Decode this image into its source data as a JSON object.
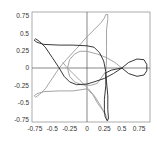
{
  "chart_data": {
    "type": "line",
    "title": "",
    "xlabel": "",
    "ylabel": "",
    "xlim": [
      -0.8,
      0.9
    ],
    "ylim": [
      -0.8,
      0.8
    ],
    "grid": false,
    "axes_through_origin": true,
    "x_ticks": [
      -0.75,
      -0.5,
      -0.25,
      0,
      0.25,
      0.5,
      0.75
    ],
    "x_tick_labels": [
      "-0.75",
      "-0.5",
      "-0.25",
      "0",
      "0.25",
      "0.5",
      "0.75"
    ],
    "y_ticks": [
      0.75,
      0.5,
      0.25,
      0,
      -0.25,
      -0.5,
      -0.75
    ],
    "y_tick_labels": [
      "0.75",
      "0.5",
      "0.25",
      "0",
      "-0.25",
      "-0.5",
      "-0.75"
    ],
    "series": [
      {
        "name": "dark curve",
        "color": "#222222",
        "points": [
          [
            -0.4,
            0.0
          ],
          [
            -0.5,
            0.15
          ],
          [
            -0.6,
            0.3
          ],
          [
            -0.68,
            0.38
          ],
          [
            -0.74,
            0.42
          ],
          [
            -0.76,
            0.4
          ],
          [
            -0.72,
            0.37
          ],
          [
            -0.62,
            0.34
          ],
          [
            -0.4,
            0.33
          ],
          [
            -0.2,
            0.33
          ],
          [
            0.0,
            0.32
          ],
          [
            0.1,
            0.3
          ],
          [
            0.18,
            0.22
          ],
          [
            0.24,
            0.1
          ],
          [
            0.27,
            -0.05
          ],
          [
            0.27,
            -0.25
          ],
          [
            0.25,
            -0.45
          ],
          [
            0.25,
            -0.6
          ],
          [
            0.26,
            -0.7
          ],
          [
            0.29,
            -0.76
          ],
          [
            0.31,
            -0.73
          ],
          [
            0.3,
            -0.6
          ],
          [
            0.3,
            -0.4
          ],
          [
            0.28,
            -0.2
          ],
          [
            0.27,
            -0.07
          ],
          [
            0.35,
            -0.03
          ],
          [
            0.5,
            0.0
          ],
          [
            0.6,
            0.08
          ],
          [
            0.72,
            0.13
          ],
          [
            0.82,
            0.12
          ],
          [
            0.86,
            0.05
          ],
          [
            0.86,
            -0.04
          ],
          [
            0.82,
            -0.1
          ],
          [
            0.72,
            -0.12
          ],
          [
            0.6,
            -0.08
          ],
          [
            0.5,
            0.0
          ],
          [
            0.38,
            -0.08
          ],
          [
            0.25,
            -0.15
          ],
          [
            0.1,
            -0.2
          ],
          [
            0.0,
            -0.23
          ],
          [
            -0.15,
            -0.24
          ],
          [
            -0.25,
            -0.2
          ],
          [
            -0.33,
            -0.12
          ],
          [
            -0.4,
            0.0
          ]
        ]
      },
      {
        "name": "gray curve",
        "color": "#9a9a9a",
        "points": [
          [
            -0.4,
            0.0
          ],
          [
            -0.5,
            -0.15
          ],
          [
            -0.6,
            -0.3
          ],
          [
            -0.68,
            -0.38
          ],
          [
            -0.74,
            -0.42
          ],
          [
            -0.76,
            -0.4
          ],
          [
            -0.72,
            -0.37
          ],
          [
            -0.62,
            -0.34
          ],
          [
            -0.4,
            -0.33
          ],
          [
            -0.2,
            -0.33
          ],
          [
            0.0,
            -0.3
          ],
          [
            0.08,
            -0.38
          ],
          [
            0.15,
            -0.5
          ],
          [
            0.22,
            -0.6
          ],
          [
            0.27,
            -0.68
          ],
          [
            0.3,
            -0.76
          ]
        ],
        "extra_paths": [
          [
            [
              0.27,
              -0.68
            ],
            [
              0.2,
              -0.55
            ],
            [
              0.12,
              -0.42
            ],
            [
              0.02,
              -0.3
            ],
            [
              -0.1,
              -0.18
            ],
            [
              -0.2,
              -0.08
            ],
            [
              -0.3,
              0.02
            ],
            [
              -0.35,
              0.08
            ]
          ],
          [
            [
              -0.4,
              0.0
            ],
            [
              -0.3,
              0.12
            ],
            [
              -0.15,
              0.28
            ],
            [
              0.0,
              0.45
            ],
            [
              0.1,
              0.55
            ],
            [
              0.2,
              0.65
            ],
            [
              0.25,
              0.72
            ],
            [
              0.27,
              0.77
            ],
            [
              0.3,
              0.77
            ],
            [
              0.3,
              0.7
            ],
            [
              0.28,
              0.55
            ],
            [
              0.28,
              0.3
            ],
            [
              0.28,
              0.1
            ],
            [
              0.27,
              -0.05
            ]
          ],
          [
            [
              0.5,
              0.0
            ],
            [
              0.4,
              0.08
            ],
            [
              0.28,
              0.15
            ],
            [
              0.15,
              0.2
            ],
            [
              0.0,
              0.24
            ],
            [
              -0.1,
              0.24
            ],
            [
              -0.18,
              0.2
            ],
            [
              -0.25,
              0.12
            ],
            [
              -0.28,
              0.0
            ],
            [
              -0.25,
              -0.12
            ],
            [
              -0.18,
              -0.2
            ],
            [
              -0.08,
              -0.24
            ],
            [
              0.05,
              -0.25
            ],
            [
              0.15,
              -0.22
            ],
            [
              0.27,
              -0.05
            ]
          ]
        ]
      }
    ]
  }
}
